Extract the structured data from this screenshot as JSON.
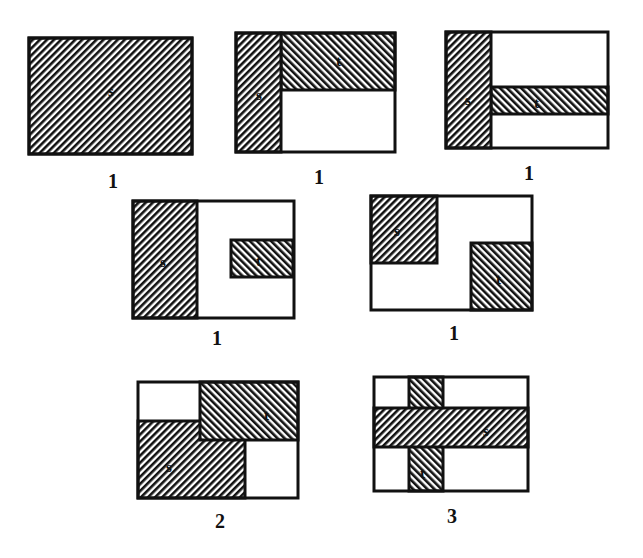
{
  "diagram": {
    "colors": {
      "ink": "#111111",
      "paper": "#ffffff"
    },
    "hatch": {
      "s": "backslash",
      "t": "slash"
    },
    "panels": [
      {
        "id": "p1",
        "count": "1",
        "frame": [
          29,
          38,
          163,
          116
        ],
        "regions": [
          {
            "name": "s",
            "hatch": "s",
            "rect": [
              29,
              38,
              163,
              116
            ],
            "label": "s",
            "lx": 108,
            "ly": 96
          }
        ],
        "countPos": [
          108,
          170
        ]
      },
      {
        "id": "p2",
        "count": "1",
        "frame": [
          236,
          33,
          159,
          119
        ],
        "regions": [
          {
            "name": "t",
            "hatch": "t",
            "rect": [
              281,
              33,
              114,
              57
            ],
            "label": "t",
            "lx": 336,
            "ly": 66
          },
          {
            "name": "s",
            "hatch": "s",
            "rect": [
              236,
              33,
              45,
              119
            ],
            "label": "s",
            "lx": 256,
            "ly": 100
          }
        ],
        "countPos": [
          314,
          166
        ]
      },
      {
        "id": "p3",
        "count": "1",
        "frame": [
          446,
          32,
          162,
          116
        ],
        "regions": [
          {
            "name": "t",
            "hatch": "t",
            "rect": [
              491,
              87,
              117,
              27
            ],
            "label": "t",
            "lx": 534,
            "ly": 108
          },
          {
            "name": "s",
            "hatch": "s",
            "rect": [
              446,
              32,
              45,
              116
            ],
            "label": "s",
            "lx": 465,
            "ly": 105
          }
        ],
        "countPos": [
          524,
          162
        ]
      },
      {
        "id": "p4",
        "count": "1",
        "frame": [
          133,
          201,
          161,
          117
        ],
        "regions": [
          {
            "name": "s",
            "hatch": "s",
            "rect": [
              133,
              201,
              64,
              117
            ],
            "label": "s",
            "lx": 160,
            "ly": 267
          },
          {
            "name": "t",
            "hatch": "t",
            "rect": [
              231,
              240,
              62,
              37
            ],
            "label": "t",
            "lx": 256,
            "ly": 266
          }
        ],
        "countPos": [
          212,
          327
        ]
      },
      {
        "id": "p5",
        "count": "1",
        "frame": [
          371,
          196,
          161,
          114
        ],
        "regions": [
          {
            "name": "s",
            "hatch": "s",
            "rect": [
              371,
              196,
              66,
              67
            ],
            "label": "s",
            "lx": 394,
            "ly": 236
          },
          {
            "name": "t",
            "hatch": "t",
            "rect": [
              471,
              243,
              61,
              67
            ],
            "label": "t",
            "lx": 496,
            "ly": 284
          }
        ],
        "countPos": [
          449,
          322
        ]
      },
      {
        "id": "p6",
        "count": "2",
        "frame": [
          138,
          382,
          160,
          116
        ],
        "regions": [
          {
            "name": "s",
            "hatch": "s",
            "rect": [
              138,
              421,
              107,
              77
            ],
            "label": "s",
            "lx": 166,
            "ly": 472
          },
          {
            "name": "t",
            "hatch": "t",
            "rect": [
              200,
              382,
              98,
              58
            ],
            "label": "t",
            "lx": 264,
            "ly": 420
          }
        ],
        "countPos": [
          215,
          510
        ]
      },
      {
        "id": "p7",
        "count": "3",
        "frame": [
          374,
          377,
          154,
          114
        ],
        "regions": [
          {
            "name": "t",
            "hatch": "t",
            "rect": [
              409,
              377,
              34,
              114
            ],
            "label": "t",
            "lx": 420,
            "ly": 478
          },
          {
            "name": "s",
            "hatch": "s",
            "rect": [
              374,
              408,
              154,
              39
            ],
            "label": "s",
            "lx": 483,
            "ly": 436
          }
        ],
        "countPos": [
          447,
          505
        ]
      }
    ]
  }
}
